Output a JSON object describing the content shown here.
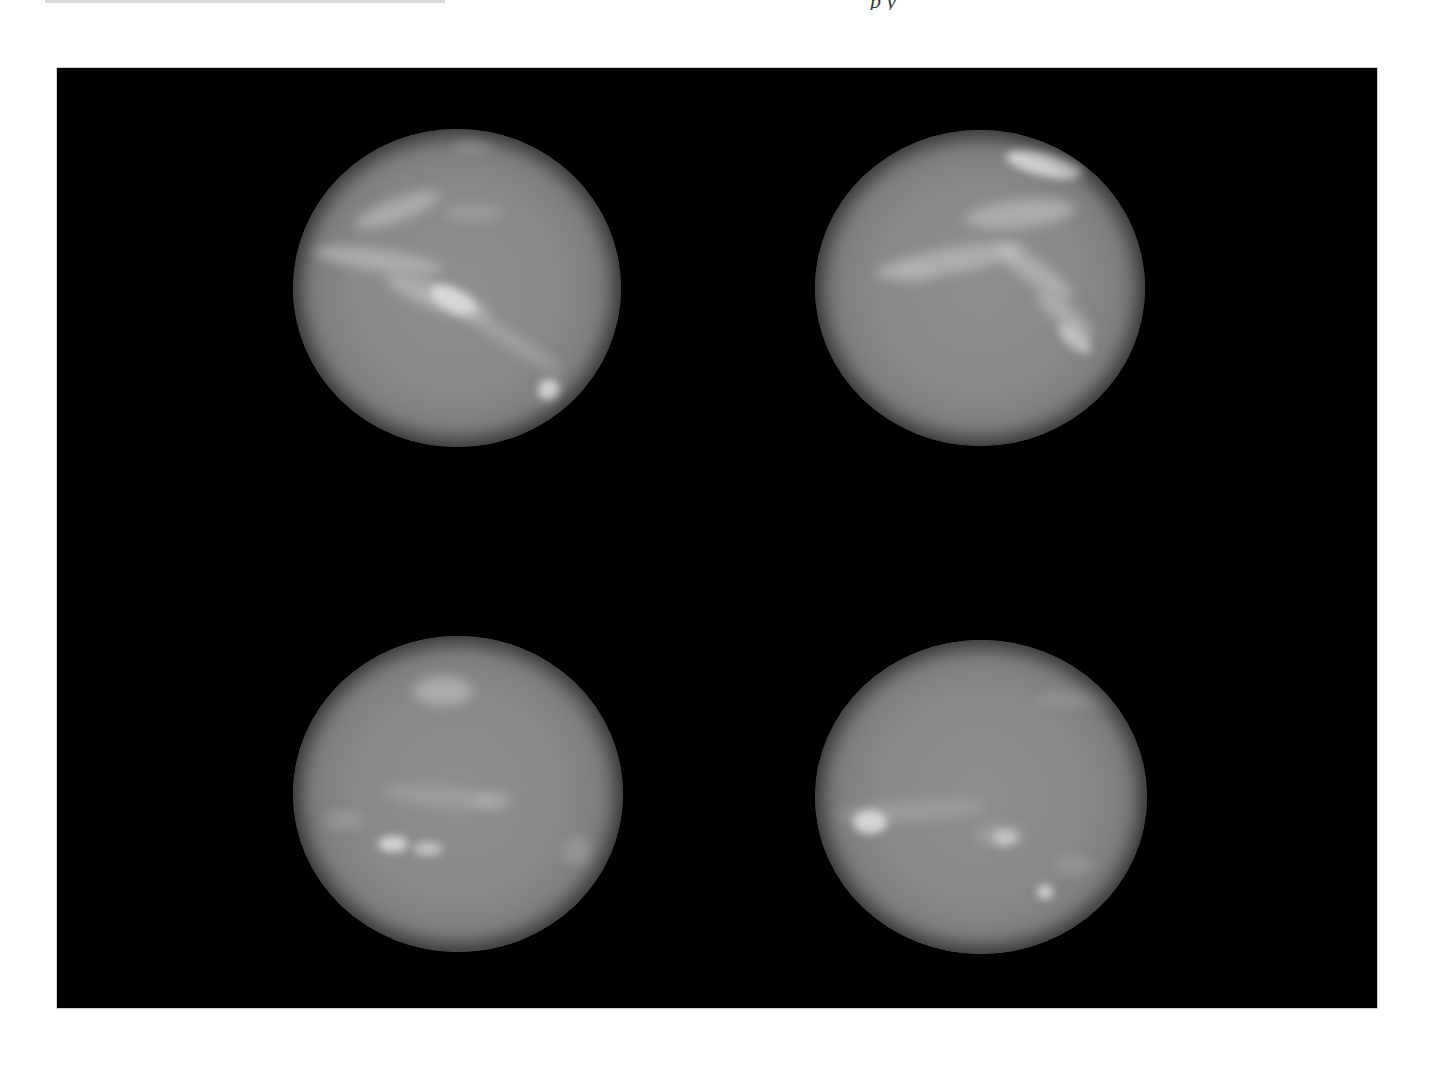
{
  "page": {
    "header": {
      "running_head_partial": "p      y",
      "note": "top text cropped, illegible"
    },
    "figure": {
      "background_color": "#000000",
      "panel_border_color": "#cfcfcf",
      "layout": "2x2 grid",
      "panels": [
        {
          "position": "top-left",
          "subject": "planet-disk",
          "tone": "grayscale"
        },
        {
          "position": "top-right",
          "subject": "planet-disk",
          "tone": "grayscale"
        },
        {
          "position": "bottom-left",
          "subject": "planet-disk",
          "tone": "grayscale"
        },
        {
          "position": "bottom-right",
          "subject": "planet-disk",
          "tone": "grayscale"
        }
      ]
    }
  }
}
